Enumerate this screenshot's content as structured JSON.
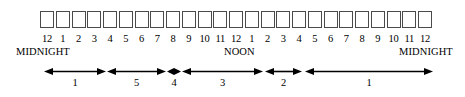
{
  "diagram": {
    "stroke_color": "#000000",
    "box_border_color": "#4a4a4a",
    "background_color": "#ffffff"
  },
  "hours": [
    {
      "label": "12"
    },
    {
      "label": "1"
    },
    {
      "label": "2"
    },
    {
      "label": "3"
    },
    {
      "label": "4"
    },
    {
      "label": "5"
    },
    {
      "label": "6"
    },
    {
      "label": "7"
    },
    {
      "label": "8"
    },
    {
      "label": "9"
    },
    {
      "label": "10"
    },
    {
      "label": "11"
    },
    {
      "label": "12"
    },
    {
      "label": "1"
    },
    {
      "label": "2"
    },
    {
      "label": "3"
    },
    {
      "label": "4"
    },
    {
      "label": "5"
    },
    {
      "label": "6"
    },
    {
      "label": "7"
    },
    {
      "label": "8"
    },
    {
      "label": "9"
    },
    {
      "label": "10"
    },
    {
      "label": "11"
    },
    {
      "label": "12"
    }
  ],
  "captions": {
    "left": "MIDNIGHT",
    "middle": "NOON",
    "right": "MIDNIGHT"
  },
  "spans": [
    {
      "label": "1",
      "start_hour": "12",
      "end_hour": "3"
    },
    {
      "label": "5",
      "start_hour": "4",
      "end_hour": "7"
    },
    {
      "label": "4",
      "start_hour": "8",
      "end_hour": "8"
    },
    {
      "label": "3",
      "start_hour": "9",
      "end_hour": "1"
    },
    {
      "label": "2",
      "start_hour": "2",
      "end_hour": "4"
    },
    {
      "label": "1",
      "start_hour": "5",
      "end_hour": "12"
    }
  ]
}
